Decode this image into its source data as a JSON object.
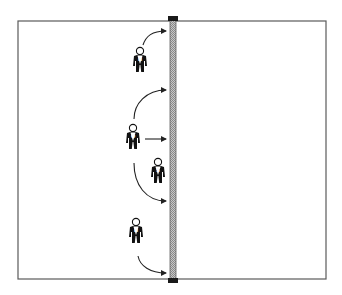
{
  "diagram": {
    "type": "volleyball-court-half-attack-pattern",
    "colors": {
      "court_line": "#5a5a5a",
      "net": "#b8b8b8",
      "net_edge": "#606060",
      "post": "#1a1a1a",
      "player": "#111111",
      "arrow": "#222222",
      "background": "#ffffff"
    },
    "court": {
      "x": 18,
      "y": 21,
      "width": 308,
      "height": 258
    },
    "net": {
      "x": 170,
      "y": 19,
      "width": 6,
      "height": 262
    },
    "players": [
      {
        "id": "top-hitter",
        "label": "H",
        "role": "Hitter",
        "x": 138,
        "y": 50
      },
      {
        "id": "middle-hitter",
        "label": "O",
        "role": "Opposite/Middle",
        "x": 131,
        "y": 127
      },
      {
        "id": "setter",
        "label": "S",
        "role": "Setter",
        "x": 156,
        "y": 161
      },
      {
        "id": "bottom-hitter",
        "label": "H",
        "role": "Hitter",
        "x": 134,
        "y": 221
      }
    ],
    "arrows": [
      {
        "id": "arrow-top",
        "from": "top-hitter",
        "path": "M143 48 C146 38 152 31 166 31"
      },
      {
        "id": "arrow-middle-up",
        "from": "middle-hitter",
        "path": "M134 120 C134 104 146 90 166 90"
      },
      {
        "id": "arrow-middle-straight",
        "from": "middle-hitter",
        "path": "M145 139 L166 139"
      },
      {
        "id": "arrow-middle-down",
        "from": "middle-hitter",
        "path": "M134 163 C134 185 146 201 166 201"
      },
      {
        "id": "arrow-bottom",
        "from": "bottom-hitter",
        "path": "M138 256 C140 266 150 273 166 273"
      }
    ]
  }
}
